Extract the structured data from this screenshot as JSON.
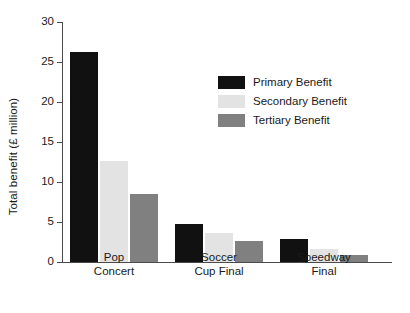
{
  "chart_data": {
    "type": "bar",
    "title": "",
    "xlabel": "",
    "ylabel": "Total benefit (£ million)",
    "categories": [
      "Pop\nConcert",
      "Soccer\nCup Final",
      "Speedway\nFinal"
    ],
    "series": [
      {
        "name": "Primary Benefit",
        "color": "#111111",
        "values": [
          26.3,
          4.8,
          2.9
        ]
      },
      {
        "name": "Secondary Benefit",
        "color": "#e3e3e3",
        "values": [
          12.6,
          3.6,
          1.6
        ]
      },
      {
        "name": "Tertiary Benefit",
        "color": "#808080",
        "values": [
          8.5,
          2.6,
          0.9
        ]
      }
    ],
    "ylim": [
      0,
      30
    ],
    "yticks": [
      0,
      5,
      10,
      15,
      20,
      25,
      30
    ],
    "ytick_labels": [
      "0",
      "5",
      "10",
      "15",
      "20",
      "25",
      "30"
    ],
    "grid": false,
    "legend_position": "upper-center-right",
    "axis_color": "#4a4a4a",
    "background": "#ffffff"
  }
}
